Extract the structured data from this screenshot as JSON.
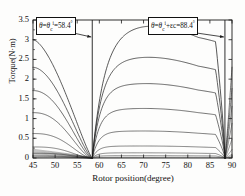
{
  "chart_data": {
    "type": "line",
    "title": "",
    "xlabel": "Rotor position(degree)",
    "ylabel": "Torque(N·m)",
    "xlim": [
      45,
      90
    ],
    "ylim": [
      0,
      3.5
    ],
    "xticks": [
      45,
      50,
      55,
      60,
      65,
      70,
      75,
      80,
      85,
      90
    ],
    "yticks": [
      0,
      0.5,
      1,
      1.5,
      2,
      2.5,
      3,
      3.5
    ],
    "grid": false,
    "legend": "none",
    "annotations": [
      {
        "id": "turn-on-angle",
        "text_plain": "θ=θcⁱ=58.4°",
        "x_value": 58.4
      },
      {
        "id": "turn-off-angle",
        "text_plain": "θ=θcⁱ+εc=88.4°",
        "x_value": 88.4
      }
    ],
    "markers": {
      "left_line_x": 58.4,
      "right_line_x": 88.4
    },
    "series_note": "Family of static torque curves for increasing excitation current; falling branch 45-58.4 deg, rising plateau branch 58.4-88.4 deg, collapse after 88.4 deg.",
    "falling_branch_start_values": [
      3.0,
      2.3,
      1.71,
      1.15,
      0.62,
      0.28,
      0.12,
      0.05,
      0.02
    ],
    "plateau_values": [
      3.2,
      2.45,
      1.82,
      1.22,
      0.67,
      0.3,
      0.13,
      0.06,
      0.02
    ],
    "peak_value": 3.22,
    "peak_x": 67
  },
  "axis": {
    "x_tick_labels": [
      "45",
      "50",
      "55",
      "60",
      "65",
      "70",
      "75",
      "80",
      "85",
      "90"
    ],
    "y_tick_labels": [
      "0",
      "0.5",
      "1",
      "1.5",
      "2",
      "2.5",
      "3",
      "3.5"
    ],
    "x_title": "Rotor position(degree)",
    "y_title": "Torque(N·m)"
  },
  "annotation_left": {
    "theta": "θ",
    "eq1": "=",
    "theta_c": "θ",
    "sub_c": "c",
    "sup_i": "i",
    "eq2": "=",
    "value": "58.4",
    "deg": "°"
  },
  "annotation_right": {
    "theta": "θ",
    "eq1": "=",
    "theta_c": "θ",
    "sub_c": "c",
    "sup_i": "i",
    "plus_eps": "+εc",
    "eq2": "=",
    "value": "88.4",
    "deg": "°"
  },
  "colors": {
    "axis": "#1a1a1a",
    "curve": "#222222",
    "background": "#fdfdfc"
  }
}
